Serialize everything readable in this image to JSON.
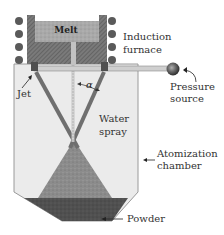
{
  "diagram": {
    "labels": {
      "melt": "Melt",
      "induction_furnace_line1": "Induction",
      "induction_furnace_line2": "furnace",
      "jet": "Jet",
      "alpha": "α",
      "pressure_source_line1": "Pressure",
      "pressure_source_line2": "source",
      "water_spray_line1": "Water",
      "water_spray_line2": "spray",
      "atomization_chamber_line1": "Atomization",
      "atomization_chamber_line2": "chamber",
      "powder": "Powder"
    },
    "colors": {
      "chamber_fill": "#ebebeb",
      "chamber_stroke": "#9a9a9a",
      "crucible_wall": "#6e6e6e",
      "melt_fill": "#a8a8a8",
      "coil": "#5a5a5a",
      "pipe": "#c9c9c9",
      "spray": "#6f6f6f",
      "cone": "#8a8a8a",
      "powder": "#4e4e4e",
      "stream": "#c2c2c2",
      "text": "#333333"
    },
    "coil_turns_per_side": 4
  }
}
